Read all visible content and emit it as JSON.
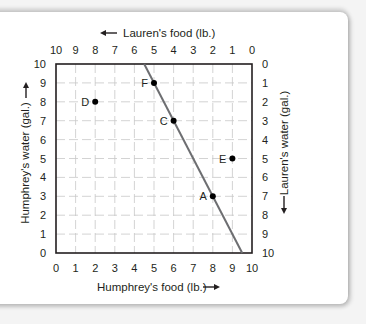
{
  "chart_data": {
    "type": "scatter",
    "title": "",
    "xlabel": "Humphrey's food (lb.)",
    "ylabel": "Humphrey's water (gal.)",
    "x2label": "Lauren's food (lb.)",
    "y2label": "Lauren's water (gal.)",
    "xlim": [
      0,
      10
    ],
    "ylim": [
      0,
      10
    ],
    "x_ticks": [
      "0",
      "1",
      "2",
      "3",
      "4",
      "5",
      "6",
      "7",
      "8",
      "9",
      "10"
    ],
    "y_ticks": [
      "0",
      "1",
      "2",
      "3",
      "4",
      "5",
      "6",
      "7",
      "8",
      "9",
      "10"
    ],
    "x2_ticks": [
      "10",
      "9",
      "8",
      "7",
      "6",
      "5",
      "4",
      "3",
      "2",
      "1",
      "0"
    ],
    "y2_ticks": [
      "10",
      "9",
      "8",
      "7",
      "6",
      "5",
      "4",
      "3",
      "2",
      "1",
      "0"
    ],
    "grid": true,
    "points": [
      {
        "label": "A",
        "x": 8,
        "y": 3
      },
      {
        "label": "C",
        "x": 6,
        "y": 7
      },
      {
        "label": "D",
        "x": 2,
        "y": 8
      },
      {
        "label": "E",
        "x": 9,
        "y": 5
      },
      {
        "label": "F",
        "x": 5,
        "y": 9
      }
    ],
    "line": {
      "name": "frontier",
      "x": [
        4.5,
        9.5
      ],
      "y": [
        10,
        0
      ],
      "color": "#6d6e71"
    },
    "colors": {
      "axis": "#231f20",
      "grid": "#c8c8c8",
      "point": "#000000"
    }
  }
}
